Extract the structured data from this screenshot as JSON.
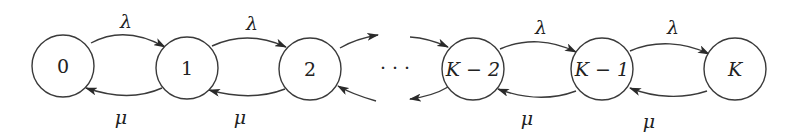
{
  "diagram": {
    "type": "birth-death-markov-chain",
    "states": [
      {
        "id": "s0",
        "label": "0",
        "cx": 63,
        "cy": 66
      },
      {
        "id": "s1",
        "label": "1",
        "cx": 187,
        "cy": 68
      },
      {
        "id": "s2",
        "label": "2",
        "cx": 310,
        "cy": 69
      },
      {
        "id": "sK2",
        "label": "K − 2",
        "cx": 473,
        "cy": 69
      },
      {
        "id": "sK1",
        "label": "K − 1",
        "cx": 602,
        "cy": 69
      },
      {
        "id": "sK",
        "label": "K",
        "cx": 735,
        "cy": 69
      }
    ],
    "ellipsis": "· · ·",
    "arrival_rate": "λ",
    "service_rate": "μ",
    "forward_labels": [
      "λ",
      "λ",
      "λ",
      "λ"
    ],
    "backward_labels": [
      "μ",
      "μ",
      "μ",
      "μ"
    ],
    "colors": {
      "stroke": "#3a3a3a",
      "text": "#222222",
      "background": "#ffffff"
    }
  }
}
